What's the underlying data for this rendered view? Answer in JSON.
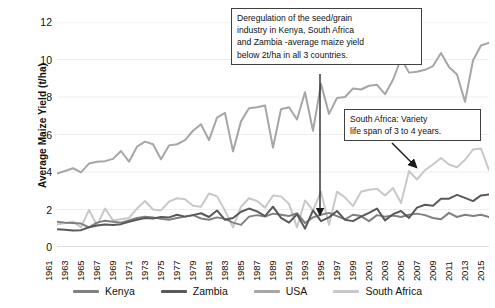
{
  "chart_data": {
    "type": "line",
    "title": "",
    "xlabel": "",
    "ylabel": "Average Maize Yield (t/ha)",
    "ylim": [
      0,
      12
    ],
    "yticks": [
      0,
      2,
      4,
      6,
      8,
      10,
      12
    ],
    "xlim": [
      1961,
      2016
    ],
    "grid": "horizontal",
    "legend_position": "bottom",
    "x": [
      1961,
      1962,
      1963,
      1964,
      1965,
      1966,
      1967,
      1968,
      1969,
      1970,
      1971,
      1972,
      1973,
      1974,
      1975,
      1976,
      1977,
      1978,
      1979,
      1980,
      1981,
      1982,
      1983,
      1984,
      1985,
      1986,
      1987,
      1988,
      1989,
      1990,
      1991,
      1992,
      1993,
      1994,
      1995,
      1996,
      1997,
      1998,
      1999,
      2000,
      2001,
      2002,
      2003,
      2004,
      2005,
      2006,
      2007,
      2008,
      2009,
      2010,
      2011,
      2012,
      2013,
      2014,
      2015
    ],
    "xtick_labels": [
      "1961",
      "1963",
      "1965",
      "1967",
      "1969",
      "1971",
      "1973",
      "1975",
      "1977",
      "1979",
      "1981",
      "1983",
      "1985",
      "1987",
      "1989",
      "1991",
      "1993",
      "1995",
      "1997",
      "1999",
      "2001",
      "2003",
      "2005",
      "2007",
      "2009",
      "2011",
      "2013",
      "2015"
    ],
    "series": [
      {
        "name": "Kenya",
        "color": "#808080",
        "values": [
          1.35,
          1.3,
          1.28,
          1.25,
          1.05,
          1.3,
          1.4,
          1.35,
          1.3,
          1.42,
          1.55,
          1.62,
          1.58,
          1.5,
          1.45,
          1.55,
          1.62,
          1.7,
          1.52,
          1.45,
          1.58,
          1.5,
          1.3,
          1.18,
          1.62,
          1.7,
          1.62,
          1.78,
          1.72,
          1.65,
          1.8,
          1.28,
          1.58,
          1.72,
          1.82,
          1.65,
          1.48,
          1.72,
          1.65,
          1.38,
          1.7,
          1.62,
          1.68,
          1.6,
          1.72,
          1.78,
          1.7,
          1.55,
          1.48,
          1.82,
          1.6,
          1.72,
          1.65,
          1.72,
          1.6
        ]
      },
      {
        "name": "Zambia",
        "color": "#595959",
        "values": [
          0.95,
          0.92,
          0.88,
          0.9,
          1.05,
          1.15,
          1.2,
          1.18,
          1.22,
          1.35,
          1.45,
          1.55,
          1.52,
          1.6,
          1.58,
          1.72,
          1.62,
          1.7,
          1.8,
          1.6,
          1.95,
          1.45,
          1.55,
          1.88,
          2.05,
          1.9,
          1.65,
          2.15,
          1.55,
          1.3,
          1.75,
          0.98,
          1.95,
          1.38,
          1.58,
          1.92,
          1.45,
          1.38,
          1.62,
          1.82,
          2.05,
          1.42,
          1.75,
          1.92,
          1.55,
          2.1,
          2.25,
          2.2,
          2.58,
          2.58,
          2.78,
          2.62,
          2.45,
          2.75,
          2.8
        ]
      },
      {
        "name": "USA",
        "color": "#a6a6a6",
        "values": [
          3.92,
          4.05,
          4.2,
          3.98,
          4.45,
          4.55,
          4.58,
          4.7,
          5.12,
          4.55,
          5.35,
          5.62,
          5.48,
          4.68,
          5.42,
          5.48,
          5.7,
          6.2,
          6.55,
          5.7,
          6.9,
          7.15,
          5.1,
          6.7,
          7.4,
          7.45,
          7.55,
          5.3,
          7.35,
          7.45,
          6.8,
          8.25,
          6.2,
          8.7,
          7.1,
          7.95,
          8.0,
          8.45,
          8.4,
          8.6,
          8.65,
          8.15,
          8.92,
          10.05,
          9.3,
          9.35,
          9.45,
          9.65,
          10.35,
          9.6,
          9.2,
          7.75,
          9.95,
          10.75,
          10.9
        ]
      },
      {
        "name": "South Africa",
        "color": "#c8c8c8",
        "values": [
          1.2,
          1.28,
          1.35,
          1.05,
          1.98,
          1.15,
          2.05,
          1.42,
          1.48,
          1.55,
          2.05,
          2.45,
          2.0,
          1.95,
          2.42,
          2.6,
          2.55,
          2.2,
          2.15,
          2.85,
          2.7,
          1.95,
          1.05,
          2.15,
          2.6,
          2.45,
          2.1,
          2.75,
          2.7,
          2.3,
          1.05,
          2.48,
          1.95,
          2.95,
          1.18,
          2.95,
          2.65,
          2.18,
          2.95,
          3.05,
          3.1,
          2.75,
          3.15,
          2.35,
          4.05,
          3.6,
          4.1,
          4.4,
          4.75,
          4.4,
          4.25,
          4.65,
          5.2,
          5.25,
          4.1
        ]
      }
    ],
    "annotations": [
      {
        "id": "deregulation",
        "lines": [
          "Deregulation of the seed/grain",
          "industry in Kenya, South Africa",
          "and Zambia -average maize yield",
          "below 2t/ha in all 3 countries."
        ],
        "points_to_year": 1995
      },
      {
        "id": "south-africa-variety",
        "lines": [
          "South Africa: Variety",
          "life span of 3 to 4 years."
        ],
        "points_to_year": 2005
      }
    ]
  }
}
